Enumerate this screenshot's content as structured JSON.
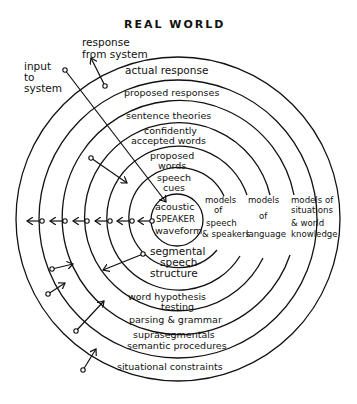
{
  "title": "REAL   WORLD",
  "external": {
    "response_from_system": [
      "response",
      "from system"
    ],
    "input_to_system": [
      "input",
      "to",
      "system"
    ]
  },
  "rings_top_labels": [
    "actual  response",
    "proposed responses",
    "sentence  theories",
    [
      "confidently",
      "accepted words"
    ],
    [
      "proposed",
      "words"
    ],
    [
      "speech",
      "cues"
    ]
  ],
  "center": [
    "acoustic",
    "SPEAKER",
    "waveform"
  ],
  "models": {
    "speech": [
      "models",
      "of",
      "speech",
      "& speakers"
    ],
    "language": [
      "models",
      "of",
      "language"
    ],
    "world": [
      "models of",
      "situations",
      "& world",
      "knowledge"
    ]
  },
  "rings_bottom_labels": [
    [
      "segmental",
      "speech",
      "structure"
    ],
    [
      "word  hypothesis",
      "testing"
    ],
    "parsing & grammar",
    "suprasegmentals",
    "semantic procedures",
    "situational constraints"
  ],
  "colors": {
    "ink": "#111111",
    "background": "#ffffff"
  }
}
